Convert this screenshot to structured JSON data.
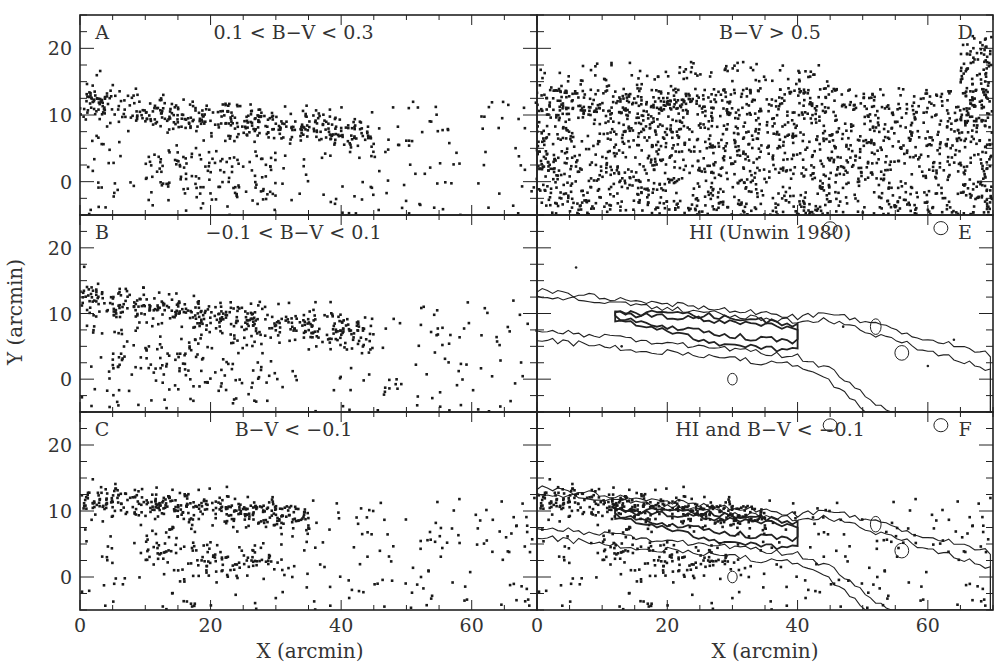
{
  "chart_data": {
    "type": "scatter",
    "layout": "3x2 panel grid (columns share Y axis, rows share X axis)",
    "xlabel": "X (arcmin)",
    "ylabel": "Y (arcmin)",
    "xlim": [
      0,
      70
    ],
    "ylim": [
      -5,
      25
    ],
    "xticks": [
      0,
      20,
      40,
      60
    ],
    "yticks": [
      0,
      10,
      20
    ],
    "x_minor_step": 5,
    "y_minor_step": 2.5,
    "point_color": "#1a1a1a",
    "contour_color": "#222222",
    "panels": [
      {
        "id": "A",
        "letter": "A",
        "title": "0.1 < B−V < 0.3",
        "letter_pos": "top-left",
        "kind": "points",
        "seed": 11,
        "count": 700,
        "clusters": [
          {
            "x": [
              0,
              45
            ],
            "y_center_at_x0": 12,
            "slope": -0.12,
            "spread": 1.4,
            "weight": 0.55
          },
          {
            "x": [
              10,
              30
            ],
            "y_center_at_x0": 3,
            "slope": -0.1,
            "spread": 2.5,
            "weight": 0.15
          },
          {
            "x": [
              0,
              70
            ],
            "y": [
              -5,
              12
            ],
            "uniform": true,
            "weight": 0.3
          }
        ]
      },
      {
        "id": "D",
        "letter": "D",
        "title": "B−V > 0.5",
        "letter_pos": "top-right",
        "kind": "points",
        "seed": 22,
        "count": 2000,
        "clusters": [
          {
            "x": [
              0,
              70
            ],
            "y": [
              -5,
              14
            ],
            "uniform": true,
            "weight": 0.85
          },
          {
            "x": [
              0,
              45
            ],
            "y": [
              10,
              18
            ],
            "uniform": true,
            "weight": 0.1
          },
          {
            "x": [
              65,
              70
            ],
            "y": [
              8,
              22
            ],
            "uniform": true,
            "weight": 0.05
          }
        ]
      },
      {
        "id": "B",
        "letter": "B",
        "title": "−0.1 < B−V < 0.1",
        "letter_pos": "top-left",
        "kind": "points",
        "seed": 33,
        "count": 650,
        "clusters": [
          {
            "x": [
              0,
              45
            ],
            "y_center_at_x0": 12.5,
            "slope": -0.13,
            "spread": 1.3,
            "weight": 0.55
          },
          {
            "x": [
              5,
              30
            ],
            "y_center_at_x0": 4,
            "slope": -0.08,
            "spread": 2.5,
            "weight": 0.15
          },
          {
            "x": [
              0,
              70
            ],
            "y": [
              -5,
              12
            ],
            "uniform": true,
            "weight": 0.3
          }
        ]
      },
      {
        "id": "E",
        "letter": "E",
        "title": "HI (Unwin 1980)",
        "letter_pos": "top-right",
        "kind": "contour",
        "seed": 44,
        "ridge": {
          "y_center_at_x0": 11,
          "slope": -0.1,
          "peak_x": 32,
          "levels": 4
        }
      },
      {
        "id": "C",
        "letter": "C",
        "title": "B−V < −0.1",
        "letter_pos": "top-left",
        "kind": "points",
        "seed": 55,
        "count": 650,
        "clusters": [
          {
            "x": [
              0,
              35
            ],
            "y_center_at_x0": 12,
            "slope": -0.08,
            "spread": 1.2,
            "weight": 0.5
          },
          {
            "x": [
              10,
              30
            ],
            "y_center_at_x0": 5,
            "slope": -0.1,
            "spread": 1.5,
            "weight": 0.15
          },
          {
            "x": [
              0,
              70
            ],
            "y": [
              -5,
              12
            ],
            "uniform": true,
            "weight": 0.35
          }
        ]
      },
      {
        "id": "F",
        "letter": "F",
        "title": "HI and B−V < −0.1",
        "letter_pos": "top-right",
        "kind": "overlay",
        "seed": 66,
        "overlay_of": [
          "C",
          "E"
        ]
      }
    ]
  }
}
